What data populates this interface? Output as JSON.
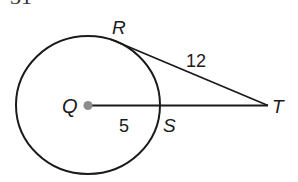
{
  "problem_number_fragment": "31",
  "diagram": {
    "circle_center_label": "Q",
    "tangent_point_label": "R",
    "intersection_label": "S",
    "external_point_label": "T",
    "tangent_length": "12",
    "radius_length": "5",
    "colors": {
      "stroke": "#1a1a1a",
      "center_dot": "#8c8c8c",
      "background": "#ffffff"
    }
  }
}
